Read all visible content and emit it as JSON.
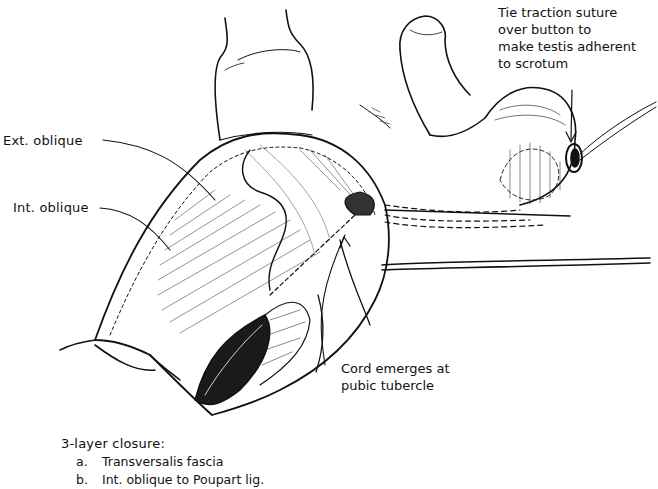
{
  "figure": {
    "ink_color": "#111111",
    "background": "#ffffff"
  },
  "labels": {
    "ext_oblique": "Ext. oblique",
    "int_oblique": "Int. oblique",
    "traction_note": {
      "line1": "Tie traction suture",
      "line2": "over button to",
      "line3": "make testis adherent",
      "line4": "to scrotum"
    },
    "cord_note": {
      "line1": "Cord emerges  at",
      "line2": "pubic tubercle"
    }
  },
  "closure": {
    "title": "3-layer closure:",
    "items": [
      {
        "letter": "a.",
        "text": "Transversalis fascia"
      },
      {
        "letter": "b.",
        "text": "Int. oblique to Poupart lig."
      }
    ]
  }
}
